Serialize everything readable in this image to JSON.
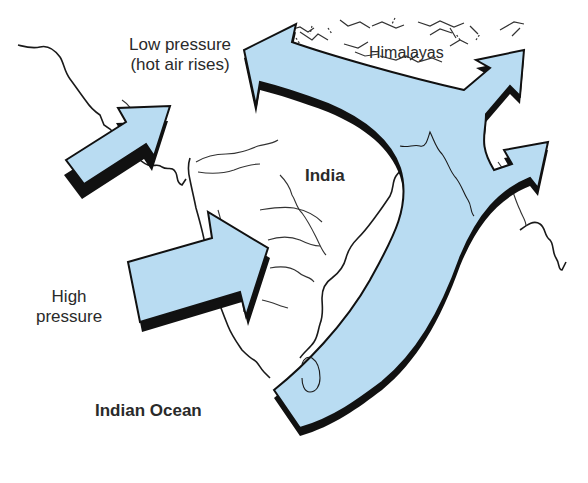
{
  "diagram": {
    "type": "monsoon-wind-map",
    "labels": {
      "low_pressure_line1": "Low pressure",
      "low_pressure_line2": "(hot air rises)",
      "high_pressure_line1": "High",
      "high_pressure_line2": "pressure",
      "india": "India",
      "indian_ocean": "Indian Ocean",
      "himalayas": "Himalayas"
    },
    "colors": {
      "arrow_fill": "#b9dcf2",
      "arrow_shadow": "#111111",
      "coastline": "#1a1a1a",
      "background": "#ffffff"
    },
    "arrows": [
      {
        "id": "west-arrow-upper",
        "direction": "northeast"
      },
      {
        "id": "west-arrow-lower",
        "direction": "east"
      },
      {
        "id": "main-curved-arrow",
        "direction": "north-then-branches",
        "branches": [
          "northwest",
          "northeast",
          "east"
        ]
      }
    ]
  }
}
